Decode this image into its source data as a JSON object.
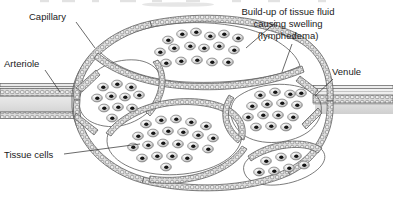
{
  "figure": {
    "width": 393,
    "height": 205,
    "background_color": "#ffffff"
  },
  "labels": {
    "capillary": "Capillary",
    "arteriole": "Arteriole",
    "tissue_cells": "Tissue cells",
    "venule": "Venule",
    "buildup_line1": "Build-up of tissue fluid",
    "buildup_line2": "causing swelling",
    "buildup_line3": "(lymphedema)"
  },
  "colors": {
    "text": "#1a1a1a",
    "leader_line": "#2a2a2a",
    "vessel_wall_stroke": "#5a5a5a",
    "wall_stipple_fill": "#d8d8d8",
    "wall_stipple_stroke": "#6e6e6e",
    "lobe_fill_light": "#f2f2f2",
    "lobe_fill_mid": "#c9c9c9",
    "lobe_fill_dark": "#9e9e9e",
    "cell_body": "#e0e0e0",
    "cell_edge": "#707070",
    "cell_nucleus": "#151515",
    "lumen_fill": "#e8e8e8",
    "cut_text_ghost": "#b9b9b9"
  },
  "structures": {
    "arteriole": {
      "name": "Arteriole",
      "position": "left",
      "description": "horizontal vessel entering from left edge"
    },
    "venule": {
      "name": "Venule",
      "position": "right",
      "description": "horizontal vessel exiting to right edge"
    },
    "capillary_bed": {
      "name": "Capillary bed",
      "lobe_count": 6,
      "description": "swollen lens-shaped capillary loops filled with tissue fluid"
    }
  },
  "cell_clusters": [
    {
      "id": "top-lobe",
      "count": 17
    },
    {
      "id": "left-lobe",
      "count": 11
    },
    {
      "id": "center-lobe",
      "count": 22
    },
    {
      "id": "right-lobe",
      "count": 15
    },
    {
      "id": "bottom-right-lobe",
      "count": 7
    }
  ]
}
